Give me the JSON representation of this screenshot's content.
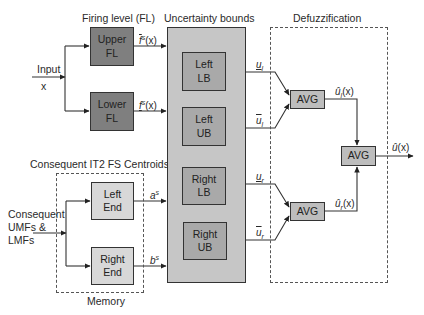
{
  "titles": {
    "firing_level": "Firing level (FL)",
    "uncertainty_bounds": "Uncertainty bounds",
    "defuzzification": "Defuzzification",
    "consequent_centroids": "Consequent IT2 FS Centroids",
    "memory": "Memory"
  },
  "inputs": {
    "input_label": "Input",
    "input_var": "x",
    "consequent_line1": "Consequent",
    "consequent_line2": "UMFs &",
    "consequent_line3": "LMFs"
  },
  "blocks": {
    "upper_fl": [
      "Upper",
      "FL"
    ],
    "lower_fl": [
      "Lower",
      "FL"
    ],
    "left_end": [
      "Left",
      "End"
    ],
    "right_end": [
      "Right",
      "End"
    ],
    "left_lb": [
      "Left",
      "LB"
    ],
    "left_ub": [
      "Left",
      "UB"
    ],
    "right_lb": [
      "Right",
      "LB"
    ],
    "right_ub": [
      "Right",
      "UB"
    ],
    "avg_left": "AVG",
    "avg_right": "AVG",
    "avg_final": "AVG"
  },
  "signals": {
    "upper_firing": {
      "base": "f",
      "sup": "s",
      "arg": "(x)",
      "bar": "over"
    },
    "lower_firing": {
      "base": "f",
      "sup": "s",
      "arg": "(x)",
      "bar": "under"
    },
    "a_s": {
      "base": "a",
      "sup": "s"
    },
    "b_s": {
      "base": "b",
      "sup": "s"
    },
    "u_l_lower": {
      "base": "u",
      "sub": "l",
      "bar": "under"
    },
    "u_l_upper": {
      "base": "u",
      "sub": "l",
      "bar": "over"
    },
    "u_r_lower": {
      "base": "u",
      "sub": "r",
      "bar": "under"
    },
    "u_r_upper": {
      "base": "u",
      "sub": "r",
      "bar": "over"
    },
    "u_hat_l": {
      "base": "û",
      "sub": "l",
      "arg": "(x)"
    },
    "u_hat_r": {
      "base": "û",
      "sub": "r",
      "arg": "(x)"
    },
    "u_hat": {
      "base": "û",
      "arg": "(x)"
    }
  }
}
